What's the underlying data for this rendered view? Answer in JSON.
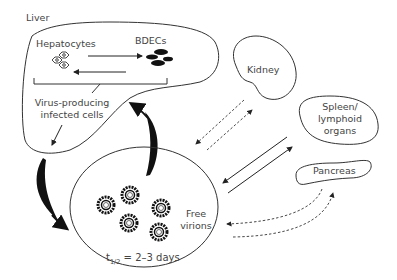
{
  "diagram": {
    "organs": {
      "liver": {
        "label": "Liver"
      },
      "kidney": {
        "label": "Kidney"
      },
      "spleen": {
        "label_line1": "Spleen/",
        "label_line2": "lymphoid",
        "label_line3": "organs"
      },
      "pancreas": {
        "label": "Pancreas"
      }
    },
    "liver_cells": {
      "hepatocytes": "Hepatocytes",
      "bdecs": "BDECs",
      "infected_line1": "Virus-producing",
      "infected_line2": "infected cells"
    },
    "free_virions": {
      "label_line1": "Free",
      "label_line2": "virions",
      "half_life_symbol": "t",
      "half_life_sub": "1/2",
      "half_life_value": " = 2–3 days",
      "virion_count": 5
    },
    "colors": {
      "line": "#333333",
      "text": "#444444",
      "fill_dark": "#111111"
    }
  }
}
